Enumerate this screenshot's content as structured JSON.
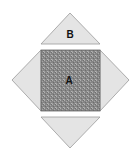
{
  "diagram": {
    "shapes": [
      {
        "id": "A",
        "type": "square",
        "label": "A",
        "fill": "#8a8a8a",
        "texture": "speckled"
      },
      {
        "id": "B",
        "type": "triangle",
        "position": "top",
        "label": "B",
        "fill": "#e4e4e4"
      },
      {
        "id": "left",
        "type": "triangle",
        "position": "left",
        "label": "",
        "fill": "#e4e4e4"
      },
      {
        "id": "right",
        "type": "triangle",
        "position": "right",
        "label": "",
        "fill": "#e4e4e4"
      },
      {
        "id": "bottom",
        "type": "triangle",
        "position": "bottom",
        "label": "",
        "fill": "#e4e4e4"
      }
    ],
    "labels": {
      "a": "A",
      "b": "B"
    },
    "colors": {
      "square_fill": "#8a8a8a",
      "triangle_fill": "#e4e4e4",
      "stroke": "#9a9a9a"
    }
  }
}
